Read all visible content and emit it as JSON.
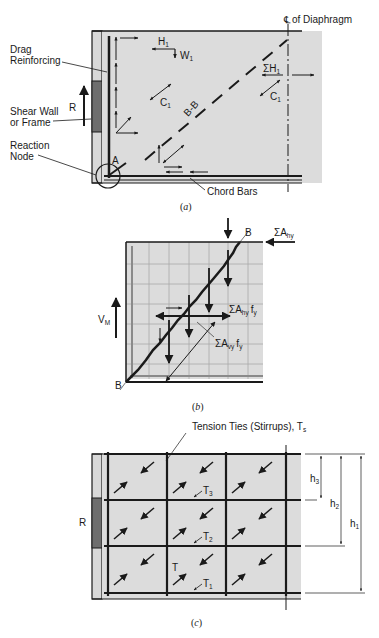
{
  "figure_a": {
    "caption_open": "(",
    "caption_letter": "a",
    "caption_close": ")",
    "centerline_symbol": "℄",
    "centerline_text": "of Diaphragm",
    "labels": {
      "drag_1": "Drag",
      "drag_2": "Reinforcing",
      "shear_1": "Shear Wall",
      "shear_2": "or Frame",
      "reaction_1": "Reaction",
      "reaction_2": "Node",
      "R": "R",
      "A": "A",
      "H1": "H",
      "H1_sub": "1",
      "W1": "W",
      "W1_sub": "1",
      "C1": "C",
      "C1_sub": "1",
      "BB": "B-B",
      "sumH": "ΣH",
      "sumH_sub": "1",
      "C1b": "C",
      "C1b_sub": "1",
      "chord": "Chord Bars"
    }
  },
  "figure_b": {
    "caption_open": "(",
    "caption_letter": "b",
    "caption_close": ")",
    "labels": {
      "B_top": "B",
      "B_bottom": "B",
      "sumAhy": "ΣA",
      "sumAhy_sub": "hy",
      "VM": "V",
      "VM_sub": "M",
      "sumAhyfy": "ΣA",
      "sumAhyfy_sub": "hy",
      "sumAhyfy_f": "f",
      "sumAhyfy_fsub": "y",
      "sumAvyfy": "ΣA",
      "sumAvyfy_sub": "vy",
      "sumAvyfy_f": "f",
      "sumAvyfy_fsub": "y"
    }
  },
  "figure_c": {
    "caption_open": "(",
    "caption_letter": "c",
    "caption_close": ")",
    "labels": {
      "ties": "Tension Ties (Stirrups), T",
      "ties_sub": "s",
      "R": "R",
      "T": "T",
      "T1": "T",
      "T1_sub": "1",
      "T2": "T",
      "T2_sub": "2",
      "T3": "T",
      "T3_sub": "3",
      "h1": "h",
      "h1_sub": "1",
      "h2": "h",
      "h2_sub": "2",
      "h3": "h",
      "h3_sub": "3"
    }
  },
  "colors": {
    "panel_fill": "#dcdcdc",
    "wall_fill": "#6e6e6e",
    "ink": "#1a1a1a",
    "grid": "#a8a8a8"
  }
}
